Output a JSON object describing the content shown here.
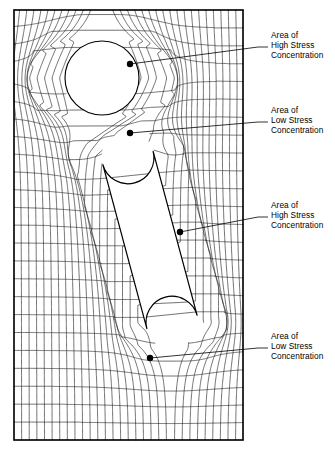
{
  "figure": {
    "name": "stress-flow-analogy",
    "background_color": "#ffffff",
    "line_color": "#1a1a1a",
    "border_color": "#000000",
    "text_color": "#000000"
  },
  "plate": {
    "x": 14,
    "y": 10,
    "width": 229,
    "height": 430
  },
  "holes": [
    {
      "name": "circular-hole",
      "type": "circle",
      "cx": 102,
      "cy": 78,
      "r": 37
    },
    {
      "name": "inclined-slot",
      "type": "stadium",
      "cap_top": {
        "cx": 128,
        "cy": 158,
        "r": 26
      },
      "cap_bottom": {
        "cx": 172,
        "cy": 322,
        "r": 26
      }
    }
  ],
  "annotations": [
    {
      "id": "high-stress-top",
      "lines": [
        "Area of",
        "High Stress",
        "Concentration"
      ],
      "stress_level": "High",
      "dot": {
        "x": 130,
        "y": 64
      },
      "label_x": 271,
      "label_y": 38,
      "dash_x1": 258,
      "dash_x2": 268,
      "dash_y": 47,
      "leader": [
        [
          130,
          64
        ],
        [
          258,
          47
        ]
      ]
    },
    {
      "id": "low-stress-upper",
      "lines": [
        "Area of",
        "Low Stress",
        "Concentration"
      ],
      "stress_level": "Low",
      "dot": {
        "x": 130,
        "y": 133
      },
      "label_x": 271,
      "label_y": 113,
      "dash_x1": 258,
      "dash_x2": 268,
      "dash_y": 122,
      "leader": [
        [
          130,
          133
        ],
        [
          258,
          122
        ]
      ]
    },
    {
      "id": "high-stress-slot",
      "lines": [
        "Area of",
        "High Stress",
        "Concentration"
      ],
      "stress_level": "High",
      "dot": {
        "x": 180,
        "y": 232
      },
      "label_x": 271,
      "label_y": 208,
      "dash_x1": 258,
      "dash_x2": 268,
      "dash_y": 217,
      "leader": [
        [
          180,
          232
        ],
        [
          258,
          217
        ]
      ]
    },
    {
      "id": "low-stress-lower",
      "lines": [
        "Area of",
        "Low Stress",
        "Concentration"
      ],
      "stress_level": "Low",
      "dot": {
        "x": 150,
        "y": 358
      },
      "label_x": 271,
      "label_y": 339,
      "dash_x1": 258,
      "dash_x2": 268,
      "dash_y": 348,
      "leader": [
        [
          150,
          358
        ],
        [
          258,
          348
        ]
      ]
    }
  ],
  "field": {
    "n_streamlines": 30,
    "n_crosslines": 24,
    "dot_radius": 3.2
  }
}
